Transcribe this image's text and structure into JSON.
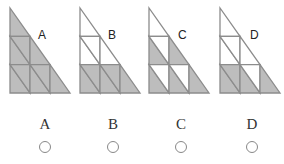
{
  "colors": {
    "shade": "#bdbdbd",
    "stroke": "#8c8c8c",
    "background": "#ffffff"
  },
  "figures": [
    {
      "label": "A",
      "x": 10,
      "label_x": 38,
      "label_y": 35,
      "shading": {
        "top_edge": true,
        "mid_c0_lower": true,
        "mid_c0_upper": true,
        "mid_edge": true,
        "bot_c0_lower": true,
        "bot_c0_upper": true,
        "bot_c1_lower": true,
        "bot_c1_upper": true,
        "bot_edge": true
      }
    },
    {
      "label": "B",
      "x": 80,
      "label_x": 108,
      "label_y": 35,
      "shading": {
        "top_edge": false,
        "mid_c0_lower": false,
        "mid_c0_upper": false,
        "mid_edge": false,
        "bot_c0_lower": true,
        "bot_c0_upper": true,
        "bot_c1_lower": true,
        "bot_c1_upper": true,
        "bot_edge": true
      }
    },
    {
      "label": "C",
      "x": 149,
      "label_x": 178,
      "label_y": 35,
      "shading": {
        "top_edge": false,
        "mid_c0_lower": true,
        "mid_c0_upper": false,
        "mid_edge": true,
        "bot_c0_lower": true,
        "bot_c0_upper": false,
        "bot_c1_lower": true,
        "bot_c1_upper": false,
        "bot_edge": true
      }
    },
    {
      "label": "D",
      "x": 220,
      "label_x": 250,
      "label_y": 35,
      "shading": {
        "top_edge": false,
        "mid_c0_lower": false,
        "mid_c0_upper": false,
        "mid_edge": false,
        "bot_c0_lower": true,
        "bot_c0_upper": true,
        "bot_c1_lower": true,
        "bot_c1_upper": false,
        "bot_edge": true
      }
    }
  ],
  "options": [
    {
      "label": "A",
      "x": 45,
      "selected": false
    },
    {
      "label": "B",
      "x": 113,
      "selected": false
    },
    {
      "label": "C",
      "x": 181,
      "selected": false
    },
    {
      "label": "D",
      "x": 252,
      "selected": false
    }
  ]
}
